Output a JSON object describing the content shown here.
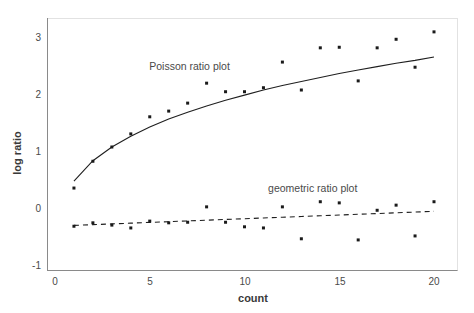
{
  "chart_data": {
    "type": "scatter",
    "title": "",
    "xlabel": "count",
    "ylabel": "log ratio",
    "xlim": [
      0,
      20.8
    ],
    "ylim": [
      -1,
      3.35
    ],
    "grid": false,
    "legend_position": "inline-annotations",
    "x_ticks": [
      "0",
      "5",
      "10",
      "15",
      "20"
    ],
    "x_tick_values": [
      0,
      5,
      10,
      15,
      20
    ],
    "y_ticks": [
      "-1",
      "0",
      "1",
      "2",
      "3"
    ],
    "y_tick_values": [
      -1,
      0,
      1,
      2,
      3
    ],
    "x": [
      1,
      2,
      3,
      4,
      5,
      6,
      7,
      8,
      9,
      10,
      11,
      12,
      13,
      14,
      15,
      16,
      17,
      18,
      19,
      20
    ],
    "series": [
      {
        "name": "Poisson ratio plot",
        "marker": "square",
        "values": [
          0.35,
          0.82,
          1.07,
          1.3,
          1.6,
          1.7,
          1.84,
          2.19,
          2.04,
          2.04,
          2.11,
          2.56,
          2.07,
          2.81,
          2.82,
          2.23,
          2.81,
          2.96,
          2.47,
          3.09
        ],
        "fit_line_style": "solid",
        "fit_x": [
          1,
          2,
          3,
          4,
          5,
          6,
          7,
          8,
          9,
          10,
          11,
          12,
          13,
          14,
          15,
          16,
          17,
          18,
          19,
          20
        ],
        "fit_values": [
          0.47,
          0.83,
          1.07,
          1.26,
          1.42,
          1.56,
          1.68,
          1.79,
          1.89,
          1.98,
          2.07,
          2.15,
          2.22,
          2.29,
          2.36,
          2.42,
          2.48,
          2.54,
          2.59,
          2.65
        ]
      },
      {
        "name": "geometric ratio plot",
        "marker": "square",
        "values": [
          -0.32,
          -0.26,
          -0.3,
          -0.35,
          -0.23,
          -0.26,
          -0.25,
          0.02,
          -0.25,
          -0.33,
          -0.35,
          0.02,
          -0.54,
          0.11,
          0.09,
          -0.56,
          -0.04,
          0.05,
          -0.49,
          0.11
        ],
        "fit_line_style": "dashed",
        "fit_x": [
          1,
          2,
          3,
          4,
          5,
          6,
          7,
          8,
          9,
          10,
          11,
          12,
          13,
          14,
          15,
          16,
          17,
          18,
          19,
          20
        ],
        "fit_values": [
          -0.305,
          -0.292,
          -0.279,
          -0.266,
          -0.253,
          -0.24,
          -0.227,
          -0.214,
          -0.201,
          -0.188,
          -0.175,
          -0.162,
          -0.149,
          -0.136,
          -0.123,
          -0.11,
          -0.097,
          -0.084,
          -0.071,
          -0.058
        ]
      }
    ],
    "annotations": [
      {
        "text": "Poisson ratio plot",
        "x": 7.1,
        "y": 2.42
      },
      {
        "text": "geometric ratio plot",
        "x": 13.6,
        "y": 0.28
      }
    ],
    "colors": {
      "marker": "#1a1a1a",
      "line": "#1f1f1f",
      "axis": "#8a8a8a",
      "frame": "#e2e2e2",
      "text": "#4a4a4a",
      "background": "#ffffff"
    }
  }
}
